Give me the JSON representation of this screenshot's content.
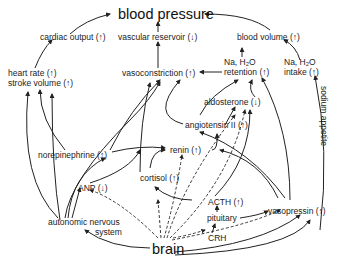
{
  "diagram": {
    "title": "blood pressure",
    "nodes": {
      "blood_pressure": "blood pressure",
      "cardiac_output": "cardiac output (↑)",
      "vascular_reservoir": "vascular reservoir (↓)",
      "blood_volume": "blood volume (↑)",
      "heart_rate": "heart rate (↑)",
      "stroke_volume": "stroke volume (↑)",
      "vasoconstriction": "vasoconstriction (↑)",
      "na_h2o_retention_1": "Na, H₂O",
      "na_h2o_retention_2": "retention (↑)",
      "na_h2o_intake_1": "Na, H₂O",
      "na_h2o_intake_2": "intake (↑)",
      "aldosterone": "aldosterone (↓)",
      "angiotensin": "angiotensin II (↑)",
      "norepinephrine": "norepinephrine (↑)",
      "renin": "renin (↑)",
      "cortisol": "cortisol (↑)",
      "anp": "ANP (↓)",
      "acth": "ACTH (↑)",
      "pituitary": "pituitary",
      "vasopressin": "vasopressin (↑)",
      "crh": "CRH",
      "autonomic_1": "autonomic nervous",
      "autonomic_2": "system",
      "brain": "brain",
      "sodium_appetite": "sodium appetite"
    },
    "colors": {
      "line": "#222222",
      "text": "#222222",
      "background": "#ffffff"
    }
  }
}
